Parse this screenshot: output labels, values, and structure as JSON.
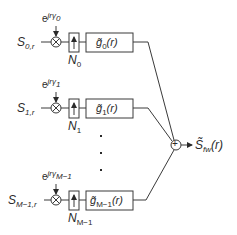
{
  "diagram": {
    "type": "block-diagram",
    "branches": [
      {
        "input_label": "S",
        "input_sub": "0,r",
        "phase_base": "e",
        "phase_exp": "jrγ",
        "phase_exp_sub": "0",
        "upsample_label": "N",
        "upsample_sub": "0",
        "filter_label": "g̃",
        "filter_sub": "0",
        "filter_arg": "(r)"
      },
      {
        "input_label": "S",
        "input_sub": "1,r",
        "phase_base": "e",
        "phase_exp": "jrγ",
        "phase_exp_sub": "1",
        "upsample_label": "N",
        "upsample_sub": "1",
        "filter_label": "g̃",
        "filter_sub": "1",
        "filter_arg": "(r)"
      },
      {
        "input_label": "S",
        "input_sub": "M−1,r",
        "phase_base": "e",
        "phase_exp": "jrγ",
        "phase_exp_sub": "M−1",
        "upsample_label": "N",
        "upsample_sub": "M−1",
        "filter_label": "g̃",
        "filter_sub": "M−1",
        "filter_arg": "(r)"
      }
    ],
    "ellipsis": "⋮",
    "summer_symbol": "+",
    "multiplier_symbol": "⊗",
    "output": {
      "label": "S̃",
      "sub": "fw",
      "arg": "(r)"
    },
    "colors": {
      "line": "#3a3a3a",
      "text": "#2a2a2a",
      "background": "#ffffff"
    }
  }
}
